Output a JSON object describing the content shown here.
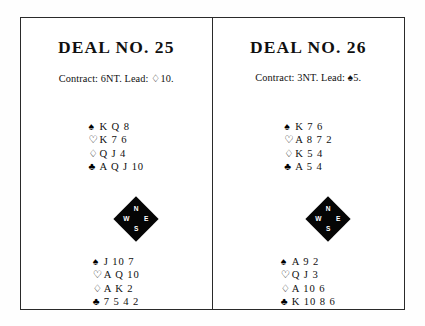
{
  "page": {
    "background_color": "#ffffff",
    "border_color": "#2a2a2a"
  },
  "compass": {
    "north": "N",
    "east": "E",
    "south": "S",
    "west": "W",
    "fill_color": "#050505",
    "label_color": "#ffffff"
  },
  "suits": {
    "spade": "♠",
    "heart": "♡",
    "diamond": "♢",
    "club": "♣"
  },
  "deals": [
    {
      "title": "DEAL NO. 25",
      "contract": "Contract: 6NT. Lead: ♢10.",
      "north": {
        "spades": "K Q 8",
        "hearts": "K 7 6",
        "diamonds": "Q J 4",
        "clubs": "A Q J 10"
      },
      "south": {
        "spades": "J 10 7",
        "hearts": "A Q 10",
        "diamonds": "A K 2",
        "clubs": "7 5 4 2"
      }
    },
    {
      "title": "DEAL NO. 26",
      "contract": "Contract: 3NT. Lead: ♠5.",
      "north": {
        "spades": "K 7 6",
        "hearts": "A 8 7 2",
        "diamonds": "K 5 4",
        "clubs": "A 5 4"
      },
      "south": {
        "spades": "A 9 2",
        "hearts": "Q J 3",
        "diamonds": "A 10 6",
        "clubs": "K 10 8 6"
      }
    }
  ]
}
